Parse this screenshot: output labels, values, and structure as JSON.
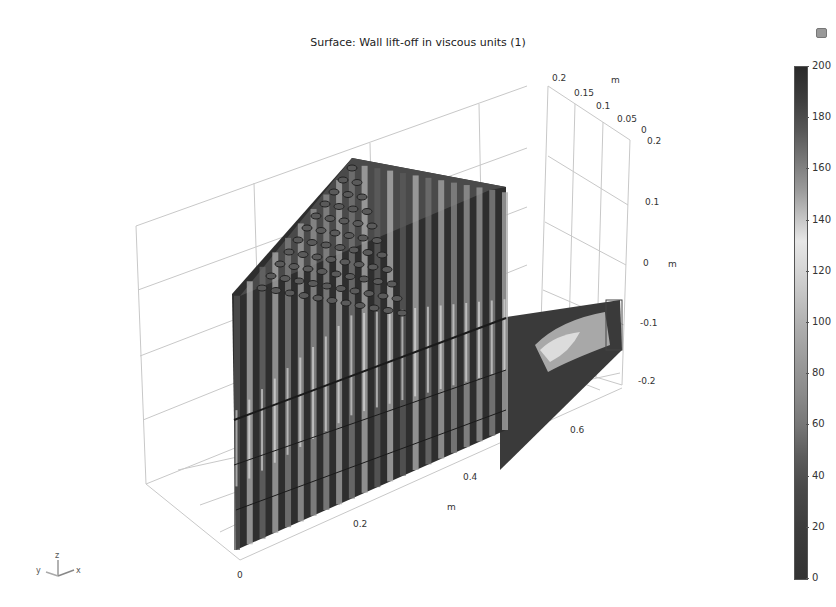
{
  "chart_data": {
    "type": "surface-3d",
    "title": "Surface: Wall lift-off in viscous units (1)",
    "quantity": "Wall lift-off in viscous units",
    "unit": "1",
    "axes": {
      "x": {
        "label": "m",
        "ticks": [
          "0",
          "0.2",
          "0.4",
          "0.6"
        ],
        "range": [
          0,
          0.7
        ]
      },
      "y": {
        "label": "m",
        "ticks": [
          "0.2",
          "0.15",
          "0.1",
          "0.05",
          "0"
        ],
        "range": [
          0,
          0.2
        ]
      },
      "z": {
        "label": "m",
        "ticks": [
          "0.2",
          "0.1",
          "0",
          "-0.1",
          "-0.2"
        ],
        "range": [
          -0.2,
          0.2
        ]
      }
    },
    "grid": true,
    "colorbar": {
      "min": 0,
      "max": 200,
      "ticks": [
        "200",
        "180",
        "160",
        "140",
        "120",
        "100",
        "80",
        "60",
        "40",
        "20",
        "0"
      ],
      "position": "right"
    },
    "geometry_description": "Triangular tube-bank heat exchanger section with vertical tubes and an outlet duct to the right"
  },
  "view": {
    "triad": {
      "z": "z",
      "y": "y",
      "x": "x"
    }
  }
}
